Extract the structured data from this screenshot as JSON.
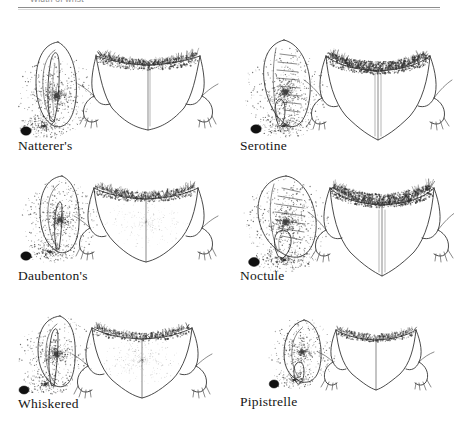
{
  "page": {
    "kind": "scanned-book-plate",
    "background_color": "#ffffff",
    "ink_color": "#2a2a2a"
  },
  "table_header": {
    "clipped_label": "Width of wrist",
    "clipped_columns": [
      "––",
      "––",
      "––",
      "––",
      "––",
      "––"
    ],
    "rule_color": "#8d8d8d",
    "note": "row is cropped by the top edge of the page"
  },
  "plate": {
    "columns": 2,
    "rows": 3,
    "species": [
      {
        "label": "Natterer's",
        "row": 1,
        "column": 1,
        "ear_shape": "tall narrow oval",
        "tragus": "long slender pointed, reaching near ear tip",
        "membrane": "broad V, dense fringe along upper edge",
        "has_eye_dot": true,
        "ear_ridges": false,
        "scale": 1.0
      },
      {
        "label": "Serotine",
        "row": 1,
        "column": 2,
        "ear_shape": "broad triangular with rounded tip",
        "tragus": "short, curved, blunt-tipped",
        "membrane": "wide V, heavy dark fringe along upper edge",
        "has_eye_dot": true,
        "ear_ridges": true,
        "scale": 1.0
      },
      {
        "label": "Daubenton's",
        "row": 2,
        "column": 1,
        "ear_shape": "short oval",
        "tragus": "straight, tapering, about half ear height",
        "membrane": "rounded V with fringed trailing edge",
        "has_eye_dot": true,
        "ear_ridges": false,
        "scale": 1.0
      },
      {
        "label": "Noctule",
        "row": 2,
        "column": 2,
        "ear_shape": "broad rounded, wider than tall",
        "tragus": "short mushroom / kidney shaped",
        "membrane": "wide V, dark dense fringe",
        "has_eye_dot": true,
        "ear_ridges": true,
        "scale": 1.0
      },
      {
        "label": "Whiskered",
        "row": 3,
        "column": 1,
        "ear_shape": "narrow pointed",
        "tragus": "long slender, pointed",
        "membrane": "V shaped, lightly furred upper surface",
        "has_eye_dot": true,
        "ear_ridges": false,
        "scale": 0.92
      },
      {
        "label": "Pipistrelle",
        "row": 3,
        "column": 2,
        "ear_shape": "small rounded triangular",
        "tragus": "short blunt, slightly curved",
        "membrane": "small narrow V with sparse fringe",
        "has_eye_dot": true,
        "ear_ridges": false,
        "scale": 0.78
      }
    ]
  }
}
